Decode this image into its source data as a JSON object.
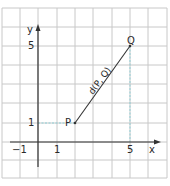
{
  "diagram": {
    "type": "coordinate-plane",
    "origin_px": {
      "x": 38,
      "y": 142
    },
    "unit_px": {
      "x": 18.4,
      "y": 19.2
    },
    "grid": {
      "x_lines_px": [
        2,
        20,
        38,
        57,
        75,
        93,
        112,
        130,
        148,
        167
      ],
      "y_lines_px": [
        8,
        27,
        46,
        65,
        84,
        103,
        123,
        142,
        160,
        178
      ],
      "color": "#c8c8c8"
    },
    "axes": {
      "x_label": "x",
      "y_label": "y",
      "color": "#333333"
    },
    "ticks": {
      "x": [
        {
          "value": -1,
          "label": "−1"
        },
        {
          "value": 1,
          "label": "1"
        },
        {
          "value": 5,
          "label": "5"
        }
      ],
      "y": [
        {
          "value": 1,
          "label": "1"
        },
        {
          "value": 5,
          "label": "5"
        }
      ]
    },
    "points": [
      {
        "name": "P",
        "label": "P",
        "x": 2,
        "y": 1
      },
      {
        "name": "Q",
        "label": "Q",
        "x": 5,
        "y": 5
      }
    ],
    "segment": {
      "from": "P",
      "to": "Q",
      "label": "d(P, Q)",
      "color": "#333333"
    },
    "guide_lines": {
      "color": "#8fd0d8",
      "horizontal_y1": "y = 1 from y-axis to P",
      "vertical_x5": "x = 5 from x-axis to Q"
    }
  }
}
